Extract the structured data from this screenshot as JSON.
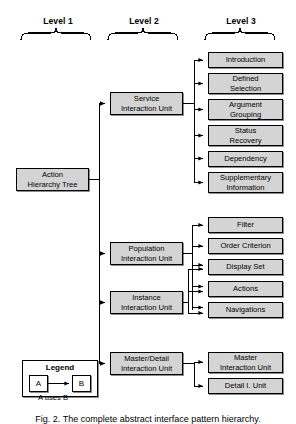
{
  "figure": {
    "caption": "Fig. 2. The complete abstract interface pattern hierarchy.",
    "levels": [
      {
        "label": "Level 1"
      },
      {
        "label": "Level 2"
      },
      {
        "label": "Level 3"
      }
    ]
  },
  "level1": {
    "nodes": [
      {
        "label": "Action Hierarchy Tree",
        "line1": "Action",
        "line2": "Hierarchy Tree"
      }
    ]
  },
  "level2": {
    "nodes": [
      {
        "label": "Service Interaction Unit",
        "line1": "Service",
        "line2": "Interaction Unit"
      },
      {
        "label": "Population Interaction Unit",
        "line1": "Population",
        "line2": "Interaction Unit"
      },
      {
        "label": "Instance Interaction Unit",
        "line1": "Instance",
        "line2": "Interaction Unit"
      },
      {
        "label": "Master/Detail Interaction Unit",
        "line1": "Master/Detail",
        "line2": "Interaction Unit"
      }
    ]
  },
  "level3": {
    "service_children": [
      {
        "label": "Introduction",
        "line1": "Introduction",
        "line2": ""
      },
      {
        "label": "Defined Selection",
        "line1": "Defined",
        "line2": "Selection"
      },
      {
        "label": "Argument Grouping",
        "line1": "Argument",
        "line2": "Grouping"
      },
      {
        "label": "Status Recovery",
        "line1": "Status",
        "line2": "Recovery"
      },
      {
        "label": "Dependency",
        "line1": "Dependency",
        "line2": ""
      },
      {
        "label": "Supplementary Information",
        "line1": "Supplementary",
        "line2": "Information"
      }
    ],
    "population_instance_children": [
      {
        "label": "Filter",
        "line1": "Filter",
        "line2": ""
      },
      {
        "label": "Order Criterion",
        "line1": "Order Criterion",
        "line2": ""
      },
      {
        "label": "Display Set",
        "line1": "Display Set",
        "line2": ""
      },
      {
        "label": "Actions",
        "line1": "Actions",
        "line2": ""
      },
      {
        "label": "Navigations",
        "line1": "Navigations",
        "line2": ""
      }
    ],
    "masterdetail_children": [
      {
        "label": "Master Interaction Unit",
        "line1": "Master",
        "line2": "Interaction Unit"
      },
      {
        "label": "Detail I. Unit",
        "line1": "Detail I. Unit",
        "line2": ""
      }
    ]
  },
  "legend": {
    "title": "Legend",
    "box_a": "A",
    "box_b": "B",
    "caption": "A uses B"
  },
  "colors": {
    "node_fill": "#d4d4d4",
    "node_border": "#000000",
    "legend_fill": "#ffffff",
    "background": "#ffffff"
  }
}
